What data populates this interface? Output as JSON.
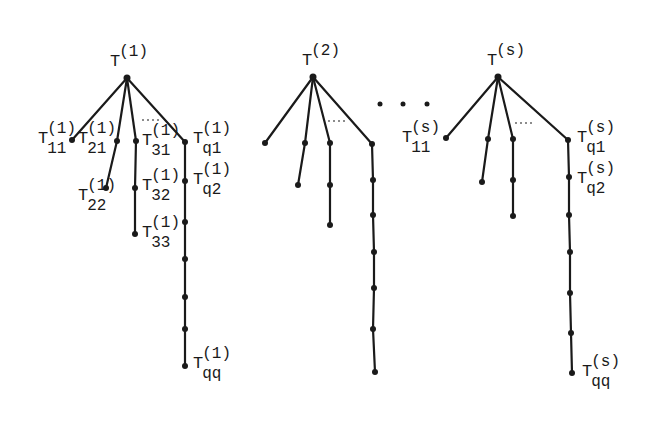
{
  "diagram": {
    "ellipsis_between_trees": "...",
    "branch_ellipsis": "...",
    "trees": [
      {
        "id": "tree-1",
        "root": {
          "label": "T",
          "sup": "(1)",
          "x": 127,
          "y": 78,
          "lx": 110,
          "ly": 66
        },
        "branches": [
          {
            "nodes": [
              {
                "x": 72,
                "y": 140,
                "label": "T",
                "sup": "(1)",
                "sub": "11",
                "lx": 38,
                "ly": 143,
                "anchor": "start"
              }
            ]
          },
          {
            "nodes": [
              {
                "x": 117,
                "y": 141,
                "label": "T",
                "sup": "(1)",
                "sub": "21",
                "lx": 78,
                "ly": 143
              },
              {
                "x": 106,
                "y": 188,
                "label": "T",
                "sup": "(1)",
                "sub": "22",
                "lx": 78,
                "ly": 200
              }
            ]
          },
          {
            "nodes": [
              {
                "x": 136,
                "y": 141,
                "label": "T",
                "sup": "(1)",
                "sub": "31",
                "lx": 142,
                "ly": 145
              },
              {
                "x": 135,
                "y": 188,
                "label": "T",
                "sup": "(1)",
                "sub": "32",
                "lx": 142,
                "ly": 190
              },
              {
                "x": 135,
                "y": 234,
                "label": "T",
                "sup": "(1)",
                "sub": "33",
                "lx": 142,
                "ly": 237
              }
            ]
          },
          {
            "nodes": [
              {
                "x": 185,
                "y": 142,
                "label": "T",
                "sup": "(1)",
                "sub": "q1",
                "lx": 193,
                "ly": 143
              },
              {
                "x": 185,
                "y": 181,
                "label": "T",
                "sup": "(1)",
                "sub": "q2",
                "lx": 193,
                "ly": 184
              },
              {
                "x": 185,
                "y": 222
              },
              {
                "x": 185,
                "y": 259
              },
              {
                "x": 185,
                "y": 297
              },
              {
                "x": 185,
                "y": 329
              },
              {
                "x": 185,
                "y": 366,
                "label": "T",
                "sup": "(1)",
                "sub": "qq",
                "lx": 193,
                "ly": 368
              }
            ]
          }
        ],
        "branch_dots": {
          "x1": 142,
          "y1": 120,
          "x2": 162,
          "y2": 120
        }
      },
      {
        "id": "tree-2",
        "root": {
          "label": "T",
          "sup": "(2)",
          "x": 313,
          "y": 77,
          "lx": 302,
          "ly": 65
        },
        "branches": [
          {
            "nodes": [
              {
                "x": 265,
                "y": 143
              }
            ]
          },
          {
            "nodes": [
              {
                "x": 305,
                "y": 143
              },
              {
                "x": 298,
                "y": 185
              }
            ]
          },
          {
            "nodes": [
              {
                "x": 330,
                "y": 143
              },
              {
                "x": 330,
                "y": 185
              },
              {
                "x": 330,
                "y": 225
              }
            ]
          },
          {
            "nodes": [
              {
                "x": 372,
                "y": 144
              },
              {
                "x": 373,
                "y": 180
              },
              {
                "x": 373,
                "y": 215
              },
              {
                "x": 374,
                "y": 252
              },
              {
                "x": 374,
                "y": 288
              },
              {
                "x": 373,
                "y": 329
              },
              {
                "x": 375,
                "y": 372
              }
            ]
          }
        ],
        "branch_dots": {
          "x1": 328,
          "y1": 121,
          "x2": 348,
          "y2": 121
        }
      },
      {
        "id": "tree-s",
        "root": {
          "label": "T",
          "sup": "(s)",
          "x": 498,
          "y": 77,
          "lx": 487,
          "ly": 65
        },
        "branches": [
          {
            "nodes": [
              {
                "x": 446,
                "y": 138,
                "label": "T",
                "sup": "(s)",
                "sub": "11",
                "lx": 402,
                "ly": 142
              }
            ]
          },
          {
            "nodes": [
              {
                "x": 488,
                "y": 139
              },
              {
                "x": 482,
                "y": 182
              }
            ]
          },
          {
            "nodes": [
              {
                "x": 513,
                "y": 139
              },
              {
                "x": 513,
                "y": 180
              },
              {
                "x": 513,
                "y": 216
              }
            ]
          },
          {
            "nodes": [
              {
                "x": 568,
                "y": 140,
                "label": "T",
                "sup": "(s)",
                "sub": "q1",
                "lx": 577,
                "ly": 142
              },
              {
                "x": 569,
                "y": 177,
                "label": "T",
                "sup": "(s)",
                "sub": "q2",
                "lx": 577,
                "ly": 183
              },
              {
                "x": 569,
                "y": 215
              },
              {
                "x": 570,
                "y": 252
              },
              {
                "x": 570,
                "y": 293
              },
              {
                "x": 571,
                "y": 333
              },
              {
                "x": 572,
                "y": 373,
                "label": "T",
                "sup": "(s)",
                "sub": "qq",
                "lx": 582,
                "ly": 376
              }
            ]
          }
        ],
        "branch_dots": {
          "x1": 515,
          "y1": 123,
          "x2": 535,
          "y2": 123
        }
      }
    ],
    "forest_dots": [
      {
        "x": 380,
        "y": 104
      },
      {
        "x": 403,
        "y": 104
      },
      {
        "x": 427,
        "y": 104
      }
    ]
  }
}
